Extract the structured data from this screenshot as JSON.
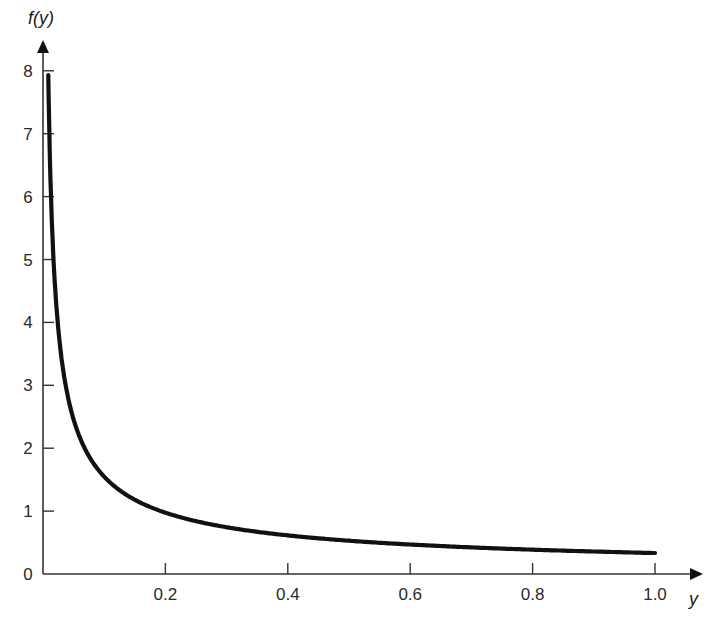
{
  "chart_data": {
    "type": "line",
    "title": "",
    "xlabel": "y",
    "ylabel": "f(y)",
    "xlim": [
      0,
      1.0
    ],
    "ylim": [
      0,
      8
    ],
    "grid": false,
    "legend": null,
    "x_ticks": [
      "0.2",
      "0.4",
      "0.6",
      "0.8",
      "1.0"
    ],
    "y_ticks": [
      "0",
      "1",
      "2",
      "3",
      "4",
      "5",
      "6",
      "7",
      "8"
    ],
    "series": [
      {
        "name": "f(y)",
        "function": "1/(3*y^(2/3))",
        "x": [
          0.0147,
          0.02,
          0.03,
          0.04,
          0.05,
          0.06,
          0.08,
          0.1,
          0.12,
          0.15,
          0.2,
          0.25,
          0.3,
          0.4,
          0.5,
          0.6,
          0.7,
          0.8,
          0.9,
          1.0
        ],
        "values": [
          5.5,
          4.52,
          3.45,
          2.85,
          2.46,
          2.17,
          1.79,
          1.55,
          1.37,
          1.18,
          0.97,
          0.84,
          0.74,
          0.61,
          0.53,
          0.47,
          0.42,
          0.39,
          0.36,
          0.33
        ]
      }
    ]
  }
}
